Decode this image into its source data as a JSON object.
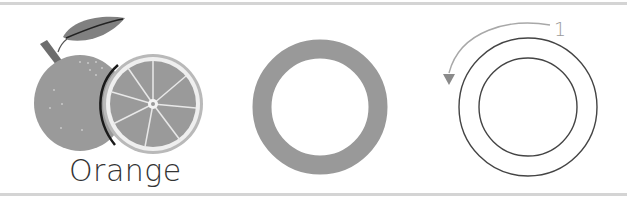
{
  "worksheet": {
    "fruit_label": "Orange",
    "trace_step_number": "1",
    "colors": {
      "fruit_fill": "#9a9a9a",
      "slice_rind": "#bdbdbd",
      "slice_pith": "#ececec",
      "ring_fill": "#999999",
      "outline_stroke": "#444444",
      "arrow_stroke": "#a8a8a8",
      "frame_line": "#d4d4d4"
    },
    "panels": [
      {
        "name": "picture",
        "description": "orange with slice and leaf"
      },
      {
        "name": "letter-shape",
        "description": "filled gray ring (letter O)"
      },
      {
        "name": "tracing",
        "description": "outline ring with counter-clockwise stroke arrow"
      }
    ]
  }
}
